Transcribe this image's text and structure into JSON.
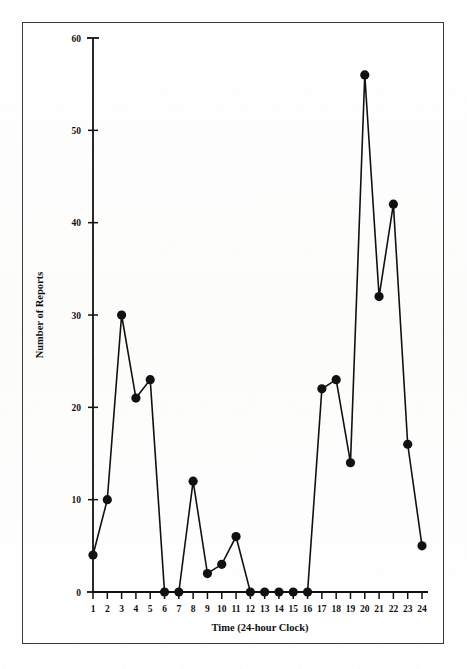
{
  "chart_data": {
    "type": "line",
    "title": "",
    "subtitle": "",
    "xlabel": "Time (24-hour Clock)",
    "ylabel": "Number of Reports",
    "x": [
      1,
      2,
      3,
      4,
      5,
      6,
      7,
      8,
      9,
      10,
      11,
      12,
      13,
      14,
      15,
      16,
      17,
      18,
      19,
      20,
      21,
      22,
      23,
      24
    ],
    "categories": [
      "1",
      "2",
      "3",
      "4",
      "5",
      "6",
      "7",
      "8",
      "9",
      "10",
      "11",
      "12",
      "13",
      "14",
      "15",
      "16",
      "17",
      "18",
      "19",
      "20",
      "21",
      "22",
      "23",
      "24"
    ],
    "values": [
      4,
      10,
      30,
      21,
      23,
      0,
      0,
      12,
      2,
      3,
      6,
      0,
      0,
      0,
      0,
      0,
      22,
      23,
      14,
      56,
      32,
      42,
      16,
      5
    ],
    "series": [
      {
        "name": "Number of Reports",
        "values": [
          4,
          10,
          30,
          21,
          23,
          0,
          0,
          12,
          2,
          3,
          6,
          0,
          0,
          0,
          0,
          0,
          22,
          23,
          14,
          56,
          32,
          42,
          16,
          5
        ]
      }
    ],
    "xlim": [
      1,
      24
    ],
    "ylim": [
      0,
      60
    ],
    "ytick_labels": [
      "0",
      "10",
      "20",
      "30",
      "40",
      "50",
      "60"
    ],
    "yticks": [
      0,
      10,
      20,
      30,
      40,
      50,
      60
    ],
    "xtick_labels": [
      "1",
      "2",
      "3",
      "4",
      "5",
      "6",
      "7",
      "8",
      "9",
      "10",
      "11",
      "12",
      "13",
      "14",
      "15",
      "16",
      "17",
      "18",
      "19",
      "20",
      "21",
      "22",
      "23",
      "24"
    ],
    "grid": false,
    "legend": null,
    "legend_position": "none",
    "marker": "filled-circle",
    "line_color": "#111111",
    "marker_color": "#111111",
    "axis_color": "#111111",
    "background_color": "#fdfdfd",
    "frame_color": "#3a3a3a",
    "annotations": []
  },
  "axis": {
    "y_title": "Number of Reports",
    "x_title": "Time (24-hour Clock)"
  }
}
